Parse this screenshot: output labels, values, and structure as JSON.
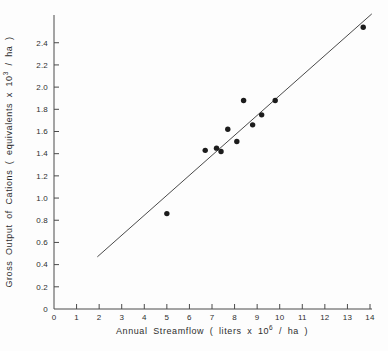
{
  "figure": {
    "background": "#fdfdfd",
    "ink": "#2e2e2e"
  },
  "chart_data": {
    "type": "scatter",
    "title": "",
    "xlabel": {
      "prefix": "Annual  Streamflow  ( liters  x  10",
      "exp": "6",
      "suffix": " / ha )"
    },
    "ylabel": {
      "prefix": "Gross  Output  of  Cations  ( equivalents  x  10",
      "exp": "3",
      "suffix": " / ha )"
    },
    "xlim": [
      0,
      14
    ],
    "ylim": [
      0,
      2.65
    ],
    "grid": false,
    "legend": null,
    "x_ticks": [
      0,
      1,
      2,
      3,
      4,
      5,
      6,
      7,
      8,
      9,
      10,
      11,
      12,
      13,
      14
    ],
    "x_tick_labels": [
      "0",
      "1",
      "2",
      "3",
      "4",
      "5",
      "6",
      "7",
      "8",
      "9",
      "10",
      "11",
      "12",
      "13",
      "14"
    ],
    "y_ticks": [
      0,
      0.2,
      0.4,
      0.6,
      0.8,
      1.0,
      1.2,
      1.4,
      1.6,
      1.8,
      2.0,
      2.2,
      2.4
    ],
    "y_tick_labels": [
      "0",
      "0.2",
      "0.4",
      "0.6",
      "0.8",
      "1.0",
      "1.2",
      "1.4",
      "1.6",
      "1.8",
      "2.0",
      "2.2",
      "2.4"
    ],
    "points": [
      {
        "x": 5.0,
        "y": 0.86
      },
      {
        "x": 6.7,
        "y": 1.43
      },
      {
        "x": 7.2,
        "y": 1.45
      },
      {
        "x": 7.4,
        "y": 1.42
      },
      {
        "x": 7.7,
        "y": 1.62
      },
      {
        "x": 8.1,
        "y": 1.51
      },
      {
        "x": 8.4,
        "y": 1.88
      },
      {
        "x": 8.8,
        "y": 1.66
      },
      {
        "x": 9.2,
        "y": 1.75
      },
      {
        "x": 9.8,
        "y": 1.88
      },
      {
        "x": 13.7,
        "y": 2.54
      }
    ],
    "trend_line": {
      "x1": 1.92,
      "y1": 0.47,
      "x2": 14.08,
      "y2": 2.66
    },
    "point_color": "#1c1c1c",
    "line_color": "#4a4a4a"
  }
}
